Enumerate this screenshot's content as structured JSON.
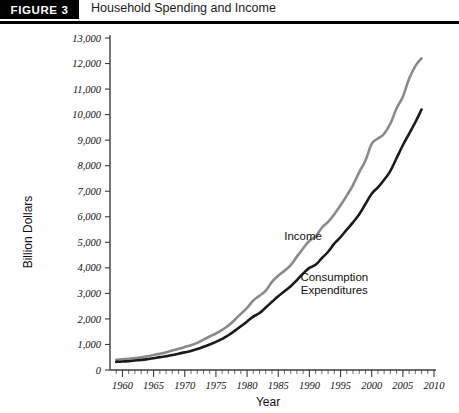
{
  "figure": {
    "badge": "FIGURE 3",
    "title": "Household Spending and Income"
  },
  "chart_data": {
    "type": "line",
    "title": "Household Spending and Income",
    "xlabel": "Year",
    "ylabel": "Billion Dollars",
    "xlim": [
      1958,
      2010
    ],
    "ylim": [
      0,
      13000
    ],
    "grid": false,
    "legend_position": "inline-annotation",
    "xticks": [
      1960,
      1965,
      1970,
      1975,
      1980,
      1985,
      1990,
      1995,
      2000,
      2005,
      2010
    ],
    "xtick_labels": [
      "1960",
      "1965",
      "1970",
      "1975",
      "1980",
      "1985",
      "1990",
      "1995",
      "2000",
      "2005",
      "2010"
    ],
    "x_minor_tick_interval": 1,
    "yticks": [
      0,
      1000,
      2000,
      3000,
      4000,
      5000,
      6000,
      7000,
      8000,
      9000,
      10000,
      11000,
      12000,
      13000
    ],
    "ytick_labels": [
      "0",
      "1,000",
      "2,000",
      "3,000",
      "4,000",
      "5,000",
      "6,000",
      "7,000",
      "8,000",
      "9,000",
      "10,000",
      "11,000",
      "12,000",
      "13,000"
    ],
    "x": [
      1959,
      1960,
      1961,
      1962,
      1963,
      1964,
      1965,
      1966,
      1967,
      1968,
      1969,
      1970,
      1971,
      1972,
      1973,
      1974,
      1975,
      1976,
      1977,
      1978,
      1979,
      1980,
      1981,
      1982,
      1983,
      1984,
      1985,
      1986,
      1987,
      1988,
      1989,
      1990,
      1991,
      1992,
      1993,
      1994,
      1995,
      1996,
      1997,
      1998,
      1999,
      2000,
      2001,
      2002,
      2003,
      2004,
      2005,
      2006,
      2007,
      2008
    ],
    "series": [
      {
        "name": "Income",
        "color": "#8a8a8a",
        "label_x": 1989,
        "label_y": 5100,
        "values": [
          400,
          420,
          440,
          470,
          500,
          540,
          590,
          640,
          690,
          760,
          830,
          900,
          970,
          1060,
          1190,
          1310,
          1430,
          1570,
          1740,
          1960,
          2200,
          2430,
          2720,
          2910,
          3110,
          3450,
          3690,
          3890,
          4110,
          4440,
          4760,
          5060,
          5230,
          5570,
          5800,
          6100,
          6450,
          6830,
          7240,
          7750,
          8200,
          8850,
          9060,
          9250,
          9650,
          10250,
          10700,
          11400,
          11900,
          12200
        ]
      },
      {
        "name": "Consumption Expenditures",
        "color": "#1a1a1a",
        "label_x": 1994,
        "label_y": 3500,
        "values": [
          320,
          335,
          345,
          370,
          395,
          425,
          460,
          505,
          535,
          590,
          640,
          690,
          745,
          820,
          910,
          1000,
          1100,
          1220,
          1360,
          1530,
          1710,
          1900,
          2090,
          2230,
          2450,
          2670,
          2890,
          3080,
          3280,
          3520,
          3780,
          4000,
          4120,
          4380,
          4630,
          4950,
          5200,
          5500,
          5780,
          6100,
          6500,
          6900,
          7150,
          7450,
          7800,
          8300,
          8800,
          9250,
          9700,
          10200
        ]
      }
    ]
  }
}
